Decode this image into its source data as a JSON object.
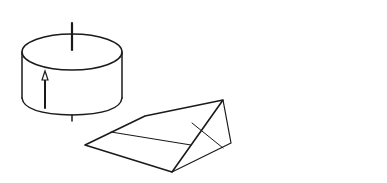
{
  "figure": {
    "colors": {
      "ink": "#1a1a1a",
      "background": "#ffffff"
    },
    "cylinder": {
      "top_label": "𝓜",
      "vector_label": "d"
    },
    "wedge": {
      "vector_label": "d"
    },
    "trough": {
      "vector_label": "d"
    }
  }
}
